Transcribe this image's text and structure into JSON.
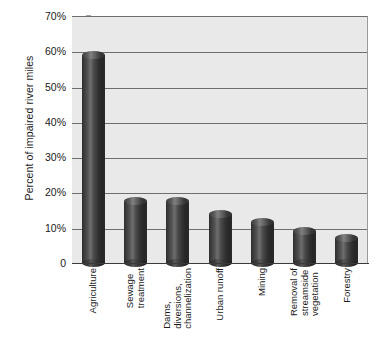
{
  "chart_data": {
    "type": "bar",
    "title": "",
    "xlabel": "",
    "ylabel": "Percent of impaired river miles",
    "ylim": [
      0,
      70
    ],
    "grid": true,
    "legend": false,
    "categories": [
      "Agriculture",
      "Sewage treatment",
      "Dams, diversions, channelization",
      "Urban runoff",
      "Mining",
      "Removal of streamside vegetation",
      "Forestry"
    ],
    "category_lines": [
      [
        "Agriculture"
      ],
      [
        "Sewage",
        "treatment"
      ],
      [
        "Dams,",
        "diversions,",
        "channelization"
      ],
      [
        "Urban runoff"
      ],
      [
        "Mining"
      ],
      [
        "Removal of",
        "streamside",
        "vegetation"
      ],
      [
        "Forestry"
      ]
    ],
    "values": [
      59,
      17.5,
      17.5,
      14,
      11.5,
      9,
      7
    ],
    "ytick_labels": [
      "70%",
      "60%",
      "50%",
      "40%",
      "30%",
      "20%",
      "10%",
      "0"
    ],
    "ytick_values": [
      70,
      60,
      50,
      40,
      30,
      20,
      10,
      0
    ]
  },
  "colors": {
    "plot_background": "#e9e9e9",
    "gridline": "#6e6e6e",
    "axis": "#3a3a3a",
    "bar_dark": "#2a2a2a",
    "bar_highlight": "#808080",
    "text": "#1a1a1a",
    "page_background": "#ffffff"
  }
}
